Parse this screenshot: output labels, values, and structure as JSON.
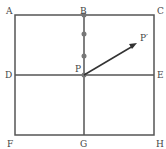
{
  "labels": {
    "A": "A",
    "B": "B",
    "C": "C",
    "D": "D",
    "P": "P",
    "E": "E",
    "F": "F",
    "G": "G",
    "H": "H",
    "P_prime": "P′"
  },
  "colors": {
    "line": "#555555",
    "point": "#777777",
    "arrow": "#333333"
  }
}
